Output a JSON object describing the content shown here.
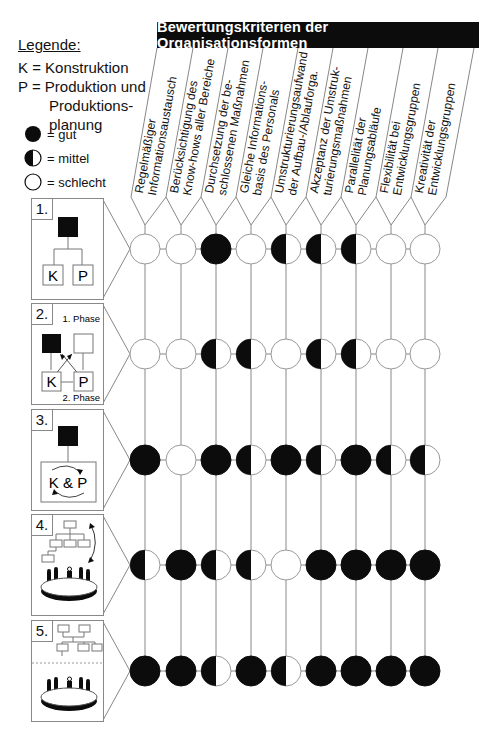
{
  "legend": {
    "title": "Legende:",
    "abbreviations": [
      {
        "line": "K = Konstruktion"
      },
      {
        "line": "P = Produktion und"
      },
      {
        "line": "Produktions-"
      },
      {
        "line": "planung"
      }
    ],
    "symbols": [
      {
        "icon": "full-circle-icon",
        "label": "= gut",
        "value": 2
      },
      {
        "icon": "half-circle-icon",
        "label": "= mittel",
        "value": 1
      },
      {
        "icon": "empty-circle-icon",
        "label": "= schlecht",
        "value": 0
      }
    ]
  },
  "header": {
    "title": "Bewertungskriterien der Organisationsformen"
  },
  "criteria": [
    {
      "line1": "Regelmäßiger",
      "line2": "Informationsaustausch"
    },
    {
      "line1": "Berücksichtigung des",
      "line2": "Know-hows aller Bereiche"
    },
    {
      "line1": "Durchsetzung der be-",
      "line2": "schlossenen Maßnahmen"
    },
    {
      "line1": "Gleiche Informations-",
      "line2": "basis des Personals"
    },
    {
      "line1": "Umstrukturierungsaufwand",
      "line2": "der Aufbau-/Ablauforga."
    },
    {
      "line1": "Akzeptanz der Umstruk-",
      "line2": "turierungsmaßnahmen"
    },
    {
      "line1": "Parallelität der",
      "line2": "Planungsabläufe"
    },
    {
      "line1": "Flexibilität bei",
      "line2": "Entwicklungsgruppen"
    },
    {
      "line1": "Kreativität der",
      "line2": "Entwicklungsgruppen"
    }
  ],
  "organisation_forms": [
    {
      "number": "1.",
      "diagram": "hierarchy-K-P",
      "labels": {
        "k": "K",
        "p": "P"
      }
    },
    {
      "number": "2.",
      "diagram": "phased-K-P",
      "labels": {
        "k": "K",
        "p": "P",
        "phase1": "1. Phase",
        "phase2": "2. Phase"
      }
    },
    {
      "number": "3.",
      "diagram": "integrated-K-and-P",
      "labels": {
        "kp": "K & P"
      }
    },
    {
      "number": "4.",
      "diagram": "org-chart-with-team-table",
      "labels": {}
    },
    {
      "number": "5.",
      "diagram": "org-chart-over-team-table",
      "labels": {}
    }
  ],
  "chart_data": {
    "type": "table",
    "title": "Bewertungskriterien der Organisationsformen",
    "scale": {
      "0": "schlecht",
      "1": "mittel",
      "2": "gut"
    },
    "columns": [
      "Regelmäßiger Informationsaustausch",
      "Berücksichtigung des Know-hows aller Bereiche",
      "Durchsetzung der beschlossenen Maßnahmen",
      "Gleiche Informationsbasis des Personals",
      "Umstrukturierungsaufwand der Aufbau-/Ablauforga.",
      "Akzeptanz der Umstrukturierungsmaßnahmen",
      "Parallelität der Planungsabläufe",
      "Flexibilität bei Entwicklungsgruppen",
      "Kreativität der Entwicklungsgruppen"
    ],
    "rows": [
      {
        "name": "1.",
        "values": [
          0,
          0,
          2,
          0,
          1,
          1,
          1,
          0,
          0
        ]
      },
      {
        "name": "2.",
        "values": [
          0,
          0,
          1,
          1,
          0,
          1,
          1,
          0,
          0
        ]
      },
      {
        "name": "3.",
        "values": [
          2,
          0,
          2,
          1,
          2,
          1,
          2,
          1,
          1
        ]
      },
      {
        "name": "4.",
        "values": [
          1,
          2,
          1,
          1,
          0,
          2,
          2,
          2,
          2
        ]
      },
      {
        "name": "5.",
        "values": [
          2,
          2,
          1,
          2,
          1,
          2,
          2,
          2,
          2
        ]
      }
    ]
  },
  "colors": {
    "ink": "#0c0c0c",
    "line": "#888888",
    "background": "#ffffff"
  }
}
